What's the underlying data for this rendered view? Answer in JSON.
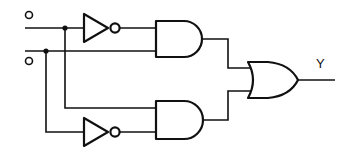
{
  "diagram": {
    "type": "logic-circuit",
    "inputs": [
      {
        "id": "A",
        "label": "",
        "terminal": "open-circle"
      },
      {
        "id": "B",
        "label": "",
        "terminal": "open-circle"
      }
    ],
    "gates": [
      {
        "id": "not1",
        "type": "NOT",
        "input": "A"
      },
      {
        "id": "not2",
        "type": "NOT",
        "input": "B"
      },
      {
        "id": "and1",
        "type": "AND",
        "inputs": [
          "not1",
          "B"
        ]
      },
      {
        "id": "and2",
        "type": "AND",
        "inputs": [
          "A",
          "not2"
        ]
      },
      {
        "id": "or1",
        "type": "OR",
        "inputs": [
          "and1",
          "and2"
        ]
      }
    ],
    "output": {
      "id": "Y",
      "label": "Y",
      "source": "or1"
    },
    "colors": {
      "stroke": "#111111",
      "background": "#ffffff"
    }
  }
}
